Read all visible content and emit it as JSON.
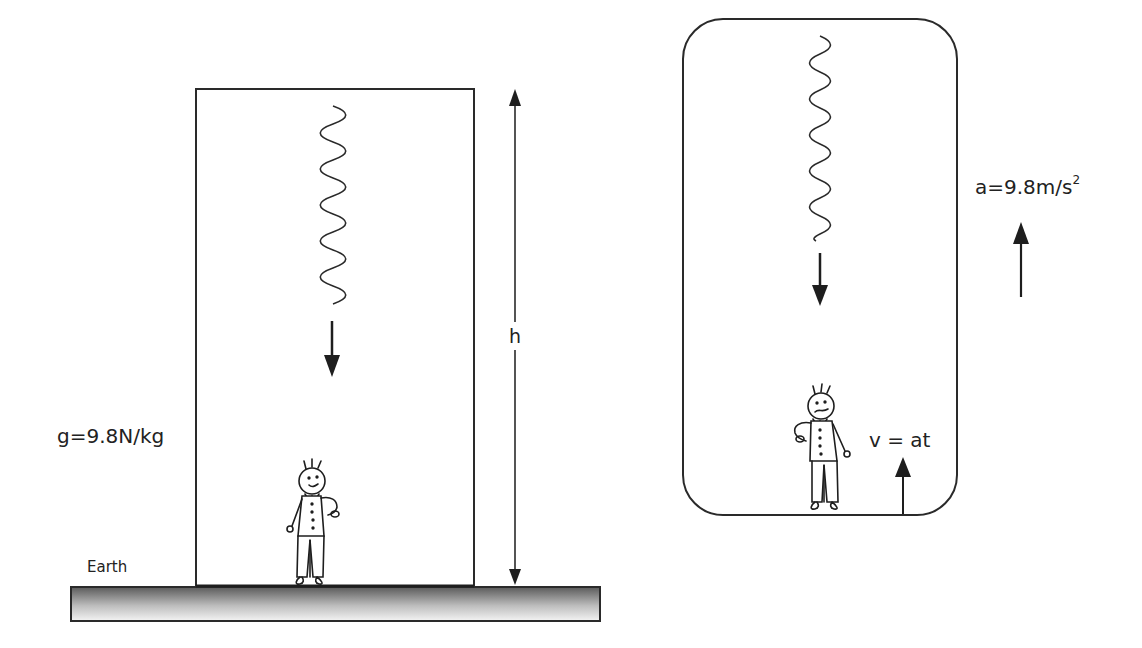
{
  "diagram": {
    "left_scene": {
      "gravity_label": "g=9.8N/kg",
      "ground_label": "Earth",
      "height_label": "h",
      "elements": [
        "stationary room on Earth",
        "falling object (wavy trail)",
        "downward arrow",
        "stick-figure observer",
        "height dimension arrow"
      ]
    },
    "right_scene": {
      "acceleration_label_base": "a=9.8m/s",
      "acceleration_label_exp": "2",
      "velocity_label": "v = at",
      "elements": [
        "accelerating rounded room",
        "falling object (wavy trail)",
        "downward arrow",
        "stick-figure observer",
        "upward acceleration arrow",
        "upward velocity arrow"
      ]
    },
    "colors": {
      "line": "#2a2a2a",
      "ground_dark": "#555555",
      "ground_light": "#f2f2f2",
      "background": "#ffffff"
    }
  }
}
